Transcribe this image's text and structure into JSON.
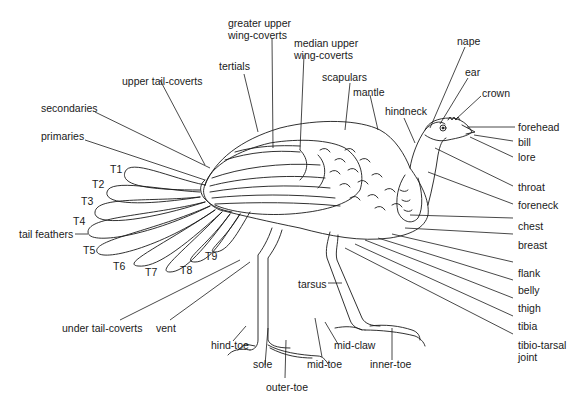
{
  "diagram": {
    "labels": {
      "greater_upper_wing_coverts": [
        "greater upper",
        "wing-coverts"
      ],
      "median_upper_wing_coverts": [
        "median upper",
        "wing-coverts"
      ],
      "nape": "nape",
      "ear": "ear",
      "crown": "crown",
      "tertials": "tertials",
      "scapulars": "scapulars",
      "mantle": "mantle",
      "hindneck": "hindneck",
      "upper_tail_coverts": "upper tail-coverts",
      "secondaries": "secondaries",
      "primaries": "primaries",
      "forehead": "forehead",
      "bill": "bill",
      "lore": "lore",
      "throat": "throat",
      "foreneck": "foreneck",
      "chest": "chest",
      "breast": "breast",
      "flank": "flank",
      "belly": "belly",
      "thigh": "thigh",
      "tibia": "tibia",
      "tibio_tarsal_joint": [
        "tibio-tarsal",
        "joint"
      ],
      "tail_feathers": "tail feathers",
      "tarsus": "tarsus",
      "under_tail_coverts": "under tail-coverts",
      "vent": "vent",
      "hind_toe": "hind-toe",
      "sole": "sole",
      "outer_toe": "outer-toe",
      "mid_toe": "mid-toe",
      "mid_claw": "mid-claw",
      "inner_toe": "inner-toe"
    },
    "tail_feathers": [
      "T1",
      "T2",
      "T3",
      "T4",
      "T5",
      "T6",
      "T7",
      "T8",
      "T9"
    ],
    "colors": {
      "line": "#1a1a1a",
      "background": "#ffffff"
    }
  }
}
